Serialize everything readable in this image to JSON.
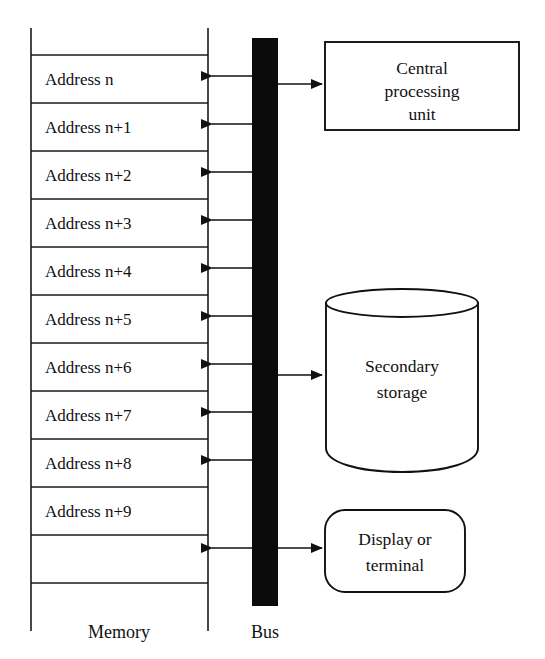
{
  "diagram": {
    "colors": {
      "line": "#111111",
      "bus_fill": "#0b0b0b",
      "background": "#ffffff",
      "text": "#111111"
    },
    "memory": {
      "caption": "Memory",
      "cells": [
        {
          "label": "Address n"
        },
        {
          "label": "Address n+1"
        },
        {
          "label": "Address n+2"
        },
        {
          "label": "Address n+3"
        },
        {
          "label": "Address n+4"
        },
        {
          "label": "Address n+5"
        },
        {
          "label": "Address n+6"
        },
        {
          "label": "Address n+7"
        },
        {
          "label": "Address n+8"
        },
        {
          "label": "Address n+9"
        }
      ]
    },
    "bus": {
      "caption": "Bus"
    },
    "devices": [
      {
        "name": "central-processing-unit",
        "shape": "rectangle",
        "lines": [
          "Central",
          "processing",
          "unit"
        ]
      },
      {
        "name": "secondary-storage",
        "shape": "cylinder",
        "lines": [
          "Secondary",
          "storage"
        ]
      },
      {
        "name": "display-or-terminal",
        "shape": "rounded-rectangle",
        "lines": [
          "Display or",
          "terminal"
        ]
      }
    ]
  }
}
